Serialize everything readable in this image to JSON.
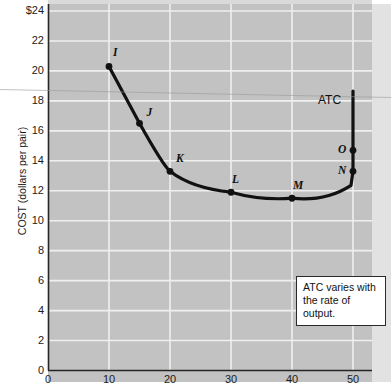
{
  "chart_data": {
    "type": "line",
    "title": "",
    "subtitle": "",
    "xlabel": "",
    "ylabel": "COST (dollars per pair)",
    "xlim": [
      0,
      55
    ],
    "ylim": [
      0,
      24
    ],
    "grid": true,
    "legend": "none",
    "series": [
      {
        "name": "ATC",
        "label": "ATC",
        "label_note": "average total cost curve",
        "color": "#111111",
        "points": [
          {
            "id": "I",
            "x": 10,
            "y": 20.3,
            "marked": true
          },
          {
            "id": "J",
            "x": 15,
            "y": 16.5,
            "marked": true
          },
          {
            "id": "K",
            "x": 20,
            "y": 13.3,
            "marked": true
          },
          {
            "id": "L",
            "x": 30,
            "y": 11.9,
            "marked": true
          },
          {
            "id": "M",
            "x": 40,
            "y": 11.5,
            "marked": true
          },
          {
            "id": "N",
            "x": 50,
            "y": 13.3,
            "marked": true
          },
          {
            "id": "O",
            "x": 50,
            "y": 14.7,
            "marked": true
          }
        ]
      }
    ],
    "yticks": [
      {
        "value": 24,
        "label": "$24"
      },
      {
        "value": 22,
        "label": "22"
      },
      {
        "value": 20,
        "label": "20"
      },
      {
        "value": 18,
        "label": "18"
      },
      {
        "value": 16,
        "label": "16"
      },
      {
        "value": 14,
        "label": "14"
      },
      {
        "value": 12,
        "label": "12"
      },
      {
        "value": 10,
        "label": "10"
      },
      {
        "value": 8,
        "label": "8"
      },
      {
        "value": 6,
        "label": "6"
      },
      {
        "value": 4,
        "label": "4"
      },
      {
        "value": 2,
        "label": "2"
      },
      {
        "value": 0,
        "label": "0"
      }
    ],
    "xticks": [
      {
        "value": 0,
        "label": "0"
      },
      {
        "value": 10,
        "label": "10"
      },
      {
        "value": 20,
        "label": "20"
      },
      {
        "value": 30,
        "label": "30"
      },
      {
        "value": 40,
        "label": "40"
      },
      {
        "value": 50,
        "label": "50"
      }
    ],
    "annotations": [
      {
        "id": "atc-callout",
        "line1": "ATC varies with",
        "line2": "the rate of output."
      }
    ]
  },
  "colors": {
    "plot_background": "#c2c2c2",
    "gridline": "#efefef",
    "axis": "#262626",
    "curve": "#111111",
    "text": "#1c1c1c"
  }
}
